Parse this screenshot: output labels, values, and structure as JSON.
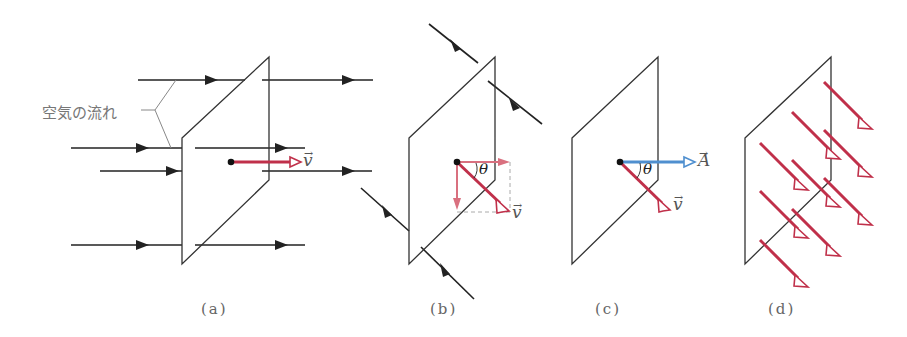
{
  "colors": {
    "velocity": "#c0304a",
    "velocity_light": "#d9707f",
    "area_vector": "#4f8fcf",
    "line": "#222222",
    "plane": "#333333",
    "label": "#666666"
  },
  "labels": {
    "air_flow": "空気の流れ",
    "velocity": "v",
    "area": "A",
    "theta": "θ",
    "arrow_over": "→"
  },
  "captions": {
    "a": "(a)",
    "b": "(b)",
    "c": "(c)",
    "d": "(d)"
  },
  "panels": [
    {
      "id": "a",
      "description": "Horizontal air flow passing through a plane perpendicular to flow; velocity v shown in red"
    },
    {
      "id": "b",
      "description": "Diagonal air flow through plane; v decomposed into components with angle θ"
    },
    {
      "id": "c",
      "description": "Area vector A (blue) normal to plane, v at angle θ"
    },
    {
      "id": "d",
      "description": "Many velocity arrows (red) crossing the plane obliquely"
    }
  ]
}
